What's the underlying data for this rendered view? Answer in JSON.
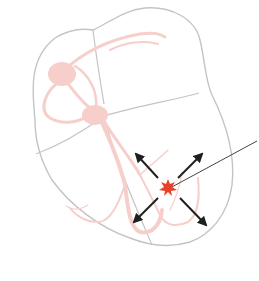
{
  "diagram": {
    "title": "",
    "colors": {
      "background": "#ffffff",
      "outline": "#c4c4c4",
      "conduction": "#f6cfcb",
      "ectopic_focus": "#e8402a",
      "arrows": "#1f1f1f",
      "pointer": "#444444"
    },
    "elements": {
      "heart_outline": "heart-outline",
      "chamber_dividers": [
        "septum-upper",
        "septum-lower",
        "av-plane-left",
        "av-plane-right"
      ],
      "sa_node": "sa-node",
      "av_node": "av-node",
      "bundle_branches": "bundle-of-his",
      "purkinje_fibers": "purkinje-fibers",
      "ectopic_focus": "ectopic-focus-star",
      "propagation_arrows": 4,
      "pointer_line": "callout-leader-line"
    }
  }
}
